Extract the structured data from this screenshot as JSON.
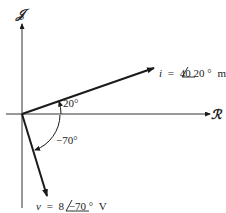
{
  "diagram": {
    "type": "phasor-diagram",
    "axes": {
      "imaginary_label": "𝒥",
      "real_label": "ℛ"
    },
    "phasors": [
      {
        "name": "current",
        "var": "i",
        "equals": "=",
        "magnitude": "40",
        "angle": "20",
        "degree": "°",
        "unit": "mA",
        "angle_deg": 20
      },
      {
        "name": "voltage",
        "var": "v",
        "equals": "=",
        "magnitude": "8",
        "angle": "−70",
        "degree": "°",
        "unit": "V",
        "angle_deg": -70
      }
    ],
    "angle_labels": {
      "current": "20°",
      "voltage": "−70°"
    },
    "colors": {
      "line": "#1a1a1a",
      "background": "#ffffff"
    }
  }
}
